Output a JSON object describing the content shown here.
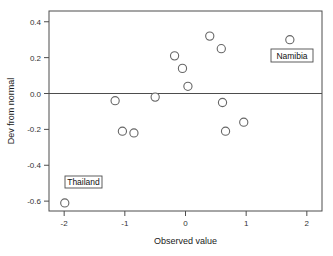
{
  "chart_data": {
    "type": "scatter",
    "title": "",
    "xlabel": "Observed value",
    "ylabel": "Dev from normal",
    "xlim": [
      -2.25,
      2.25
    ],
    "ylim": [
      -0.655,
      0.46
    ],
    "xticks": [
      -2,
      -1,
      0,
      1,
      2
    ],
    "xtick_labels": [
      "-2",
      "-1",
      "0",
      "1",
      "2"
    ],
    "yticks": [
      0.4,
      0.2,
      0.0,
      -0.2,
      -0.4,
      -0.6
    ],
    "ytick_labels": [
      "0.4",
      "0.2",
      "0.0",
      "-0.2",
      "-0.4",
      "-0.6"
    ],
    "grid": false,
    "legend": null,
    "reference_lines": [
      {
        "axis": "y",
        "value": 0.0
      }
    ],
    "marker": {
      "shape": "circle",
      "fill": "#ffffff",
      "edge": "#666666",
      "size": 4.1
    },
    "points": [
      {
        "x": -1.99,
        "y": -0.61,
        "label": "Thailand"
      },
      {
        "x": -1.16,
        "y": -0.04,
        "label": null
      },
      {
        "x": -1.04,
        "y": -0.21,
        "label": null
      },
      {
        "x": -0.85,
        "y": -0.22,
        "label": null
      },
      {
        "x": -0.5,
        "y": -0.02,
        "label": null
      },
      {
        "x": -0.18,
        "y": 0.21,
        "label": null
      },
      {
        "x": -0.05,
        "y": 0.14,
        "label": null
      },
      {
        "x": 0.04,
        "y": 0.04,
        "label": null
      },
      {
        "x": 0.4,
        "y": 0.32,
        "label": null
      },
      {
        "x": 0.59,
        "y": 0.25,
        "label": null
      },
      {
        "x": 0.61,
        "y": -0.05,
        "label": null
      },
      {
        "x": 0.66,
        "y": -0.21,
        "label": null
      },
      {
        "x": 0.96,
        "y": -0.16,
        "label": null
      },
      {
        "x": 1.72,
        "y": 0.3,
        "label": "Namibia"
      }
    ],
    "annotations": [
      {
        "text": "Thailand",
        "anchor_x": -1.99,
        "anchor_y": -0.61,
        "box_x": 65,
        "box_y": 176,
        "box_w": 37,
        "box_h": 12
      },
      {
        "text": "Namibia",
        "anchor_x": 1.72,
        "anchor_y": 0.3,
        "box_x": 271,
        "box_y": 49,
        "box_w": 42,
        "box_h": 13
      }
    ],
    "colors": {
      "background": "#ffffff",
      "axis": "#4d4d4d",
      "marker_edge": "#666666",
      "marker_fill": "#ffffff",
      "text": "#1a1a1a"
    }
  }
}
